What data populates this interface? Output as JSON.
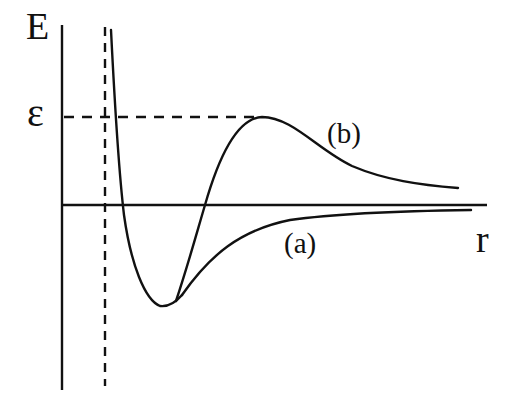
{
  "diagram": {
    "type": "potential-energy-curves",
    "labels": {
      "y_axis": "E",
      "x_axis": "r",
      "barrier_level": "ε",
      "curve_a": "(a)",
      "curve_b": "(b)"
    },
    "colors": {
      "ink": "#111111",
      "background": "#ffffff"
    },
    "geometry": {
      "y_axis": {
        "x": 62,
        "y1": 25,
        "y2": 390
      },
      "r_axis": {
        "y": 205,
        "x1": 62,
        "x2": 487
      },
      "dashed_vertical": {
        "x": 105,
        "y1": 27,
        "y2": 386
      },
      "epsilon_dashed": {
        "y": 117,
        "x1": 64,
        "x2": 258
      }
    }
  }
}
